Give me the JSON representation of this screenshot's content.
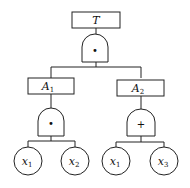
{
  "diagram": {
    "type": "fault-tree",
    "top_event": {
      "label": "T",
      "gate": "AND",
      "gate_symbol": "•"
    },
    "intermediate_events": [
      {
        "label": "A",
        "subscript": "1",
        "gate": "AND",
        "gate_symbol": "•",
        "children": [
          {
            "label": "x",
            "subscript": "1"
          },
          {
            "label": "x",
            "subscript": "2"
          }
        ]
      },
      {
        "label": "A",
        "subscript": "2",
        "gate": "OR",
        "gate_symbol": "+",
        "children": [
          {
            "label": "x",
            "subscript": "1"
          },
          {
            "label": "x",
            "subscript": "3"
          }
        ]
      }
    ]
  }
}
